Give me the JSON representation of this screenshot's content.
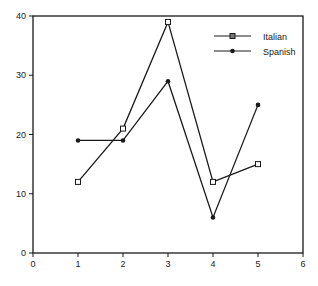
{
  "chart_data": {
    "type": "line",
    "title": "",
    "xlabel": "",
    "ylabel": "",
    "x": [
      1,
      2,
      3,
      4,
      5
    ],
    "series": [
      {
        "name": "Italian",
        "values": [
          12,
          21,
          39,
          12,
          15
        ],
        "marker": "square"
      },
      {
        "name": "Spanish",
        "values": [
          19,
          19,
          29,
          6,
          25
        ],
        "marker": "circle"
      }
    ],
    "xlim": [
      0,
      6
    ],
    "ylim": [
      0,
      40
    ],
    "xticks": [
      "0",
      "1",
      "2",
      "3",
      "4",
      "5",
      "6"
    ],
    "yticks": [
      "0",
      "10",
      "20",
      "30",
      "40"
    ],
    "grid": false,
    "legend_position": "upper right",
    "colors": {
      "line": "#1a1a1a",
      "axis": "#1a1a1a",
      "background": "#ffffff"
    }
  },
  "legend": {
    "items": [
      {
        "label": "Italian"
      },
      {
        "label": "Spanish"
      }
    ]
  }
}
